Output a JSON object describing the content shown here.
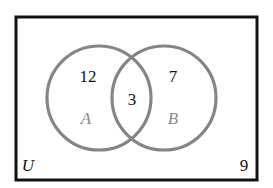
{
  "diagram": {
    "type": "venn",
    "universe": {
      "label": "U",
      "outside_count": "9"
    },
    "sets": [
      {
        "label": "A",
        "only_count": "12"
      },
      {
        "label": "B",
        "only_count": "7"
      }
    ],
    "intersection_count": "3",
    "colors": {
      "circle_stroke": "#858585",
      "border": "#111111",
      "set_label": "#8a8a8a",
      "text": "#111111"
    }
  }
}
